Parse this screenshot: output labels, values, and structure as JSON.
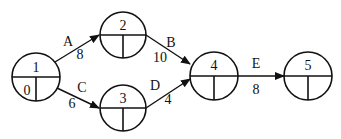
{
  "diagram": {
    "type": "activity-on-arrow network",
    "nodes": [
      {
        "id": "1",
        "label": "1",
        "cx": 36,
        "cy": 77,
        "r": 24,
        "bottom_left": "0",
        "bottom_right": ""
      },
      {
        "id": "2",
        "label": "2",
        "cx": 123,
        "cy": 35,
        "r": 23,
        "bottom_left": "",
        "bottom_right": ""
      },
      {
        "id": "3",
        "label": "3",
        "cx": 123,
        "cy": 108,
        "r": 23,
        "bottom_left": "",
        "bottom_right": ""
      },
      {
        "id": "4",
        "label": "4",
        "cx": 214,
        "cy": 76,
        "r": 24,
        "bottom_left": "",
        "bottom_right": ""
      },
      {
        "id": "5",
        "label": "5",
        "cx": 308,
        "cy": 76,
        "r": 24,
        "bottom_left": "",
        "bottom_right": ""
      }
    ],
    "edges": [
      {
        "from": "1",
        "to": "2",
        "activity": "A",
        "duration": "8"
      },
      {
        "from": "1",
        "to": "3",
        "activity": "C",
        "duration": "6"
      },
      {
        "from": "2",
        "to": "4",
        "activity": "B",
        "duration": "10"
      },
      {
        "from": "3",
        "to": "4",
        "activity": "D",
        "duration": "4"
      },
      {
        "from": "4",
        "to": "5",
        "activity": "E",
        "duration": "8"
      }
    ]
  }
}
